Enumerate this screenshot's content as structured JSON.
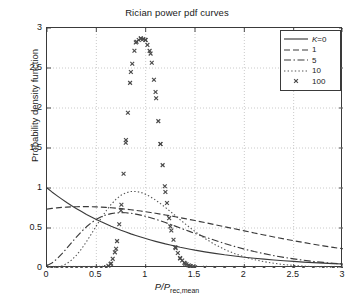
{
  "chart_data": {
    "type": "line",
    "title": "Rician power pdf curves",
    "xlabel": "P/P",
    "xlabel_sub": "rec,mean",
    "ylabel": "Probability density function",
    "xlim": [
      0,
      3
    ],
    "ylim": [
      0,
      3
    ],
    "grid": true,
    "grid_style": "dotted",
    "legend_position": "top-right",
    "xticks": [
      "0",
      "0.5",
      "1",
      "1.5",
      "2",
      "2.5",
      "3"
    ],
    "xtick_values": [
      0,
      0.5,
      1,
      1.5,
      2,
      2.5,
      3
    ],
    "yticks": [
      "0",
      "0.5",
      "1",
      "1.5",
      "2",
      "2.5",
      "3"
    ],
    "ytick_values": [
      0,
      0.5,
      1,
      1.5,
      2,
      2.5,
      3
    ],
    "x": [
      0,
      0.05,
      0.1,
      0.15,
      0.2,
      0.25,
      0.3,
      0.35,
      0.4,
      0.45,
      0.5,
      0.55,
      0.6,
      0.65,
      0.7,
      0.75,
      0.8,
      0.85,
      0.9,
      0.95,
      1,
      1.05,
      1.1,
      1.15,
      1.2,
      1.25,
      1.3,
      1.35,
      1.4,
      1.45,
      1.5,
      1.6,
      1.7,
      1.8,
      1.9,
      2,
      2.1,
      2.2,
      2.3,
      2.4,
      2.5,
      2.6,
      2.7,
      2.8,
      2.9,
      3
    ],
    "series": [
      {
        "name": "K=0",
        "label": "K=0",
        "italic_prefix": "K",
        "style": "solid",
        "color": "#3a3a3a",
        "values": [
          1,
          0.951,
          0.905,
          0.861,
          0.819,
          0.779,
          0.741,
          0.705,
          0.67,
          0.638,
          0.607,
          0.577,
          0.549,
          0.522,
          0.497,
          0.472,
          0.449,
          0.427,
          0.407,
          0.387,
          0.368,
          0.35,
          0.333,
          0.317,
          0.301,
          0.287,
          0.273,
          0.259,
          0.247,
          0.235,
          0.223,
          0.202,
          0.183,
          0.165,
          0.15,
          0.135,
          0.122,
          0.111,
          0.1,
          0.091,
          0.082,
          0.074,
          0.067,
          0.061,
          0.055,
          0.05
        ]
      },
      {
        "name": "K=1",
        "label": "1",
        "style": "dashed",
        "color": "#3a3a3a",
        "values": [
          0.736,
          0.745,
          0.752,
          0.757,
          0.761,
          0.764,
          0.766,
          0.767,
          0.767,
          0.766,
          0.764,
          0.761,
          0.757,
          0.753,
          0.748,
          0.742,
          0.735,
          0.728,
          0.72,
          0.712,
          0.703,
          0.694,
          0.684,
          0.674,
          0.663,
          0.652,
          0.641,
          0.629,
          0.617,
          0.605,
          0.593,
          0.568,
          0.542,
          0.516,
          0.49,
          0.464,
          0.438,
          0.413,
          0.388,
          0.364,
          0.341,
          0.319,
          0.297,
          0.277,
          0.258,
          0.24
        ]
      },
      {
        "name": "K=5",
        "label": "5",
        "style": "dashdot",
        "color": "#3a3a3a",
        "values": [
          0.03,
          0.062,
          0.113,
          0.176,
          0.246,
          0.319,
          0.39,
          0.456,
          0.515,
          0.566,
          0.608,
          0.64,
          0.664,
          0.68,
          0.689,
          0.692,
          0.69,
          0.684,
          0.674,
          0.661,
          0.646,
          0.628,
          0.609,
          0.589,
          0.568,
          0.546,
          0.523,
          0.5,
          0.477,
          0.455,
          0.432,
          0.388,
          0.346,
          0.306,
          0.27,
          0.236,
          0.206,
          0.179,
          0.154,
          0.133,
          0.114,
          0.097,
          0.082,
          0.07,
          0.059,
          0.05
        ]
      },
      {
        "name": "K=10",
        "label": "10",
        "style": "dotted",
        "color": "#555555",
        "values": [
          0.0,
          0.002,
          0.009,
          0.025,
          0.055,
          0.1,
          0.162,
          0.239,
          0.329,
          0.427,
          0.527,
          0.625,
          0.716,
          0.795,
          0.86,
          0.909,
          0.94,
          0.956,
          0.957,
          0.945,
          0.922,
          0.889,
          0.85,
          0.805,
          0.757,
          0.706,
          0.655,
          0.603,
          0.552,
          0.503,
          0.456,
          0.37,
          0.295,
          0.232,
          0.18,
          0.138,
          0.105,
          0.079,
          0.059,
          0.043,
          0.032,
          0.023,
          0.017,
          0.012,
          0.009,
          0.006
        ]
      },
      {
        "name": "K=100",
        "label": "100",
        "style": "markers",
        "marker": "x",
        "color": "#4a4a4a",
        "values": [
          0,
          0,
          0,
          0,
          0,
          0,
          0,
          0,
          0,
          0,
          0,
          0.001,
          0.008,
          0.055,
          0.24,
          0.72,
          1.6,
          2.45,
          2.82,
          2.87,
          2.85,
          2.68,
          2.2,
          1.55,
          0.95,
          0.52,
          0.26,
          0.12,
          0.055,
          0.024,
          0.01,
          0.002,
          0,
          0,
          0,
          0,
          0,
          0,
          0,
          0,
          0,
          0,
          0,
          0,
          0,
          0
        ]
      }
    ]
  }
}
